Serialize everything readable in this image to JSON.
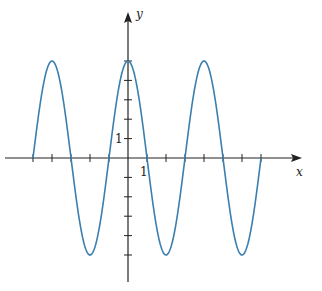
{
  "chart_data": {
    "type": "line",
    "title": "",
    "function": "y = 5cos(πx/2)",
    "xlabel": "x",
    "ylabel": "y",
    "xlim": [
      -5.2,
      8.9
    ],
    "ylim": [
      -5.6,
      6.0
    ],
    "x_tick_values": [
      -5,
      -4,
      -3,
      -2,
      -1,
      0,
      1,
      2,
      3,
      4,
      5,
      6,
      7
    ],
    "y_tick_values": [
      -5,
      -4,
      -3,
      -2,
      -1,
      1,
      2,
      3,
      4,
      5
    ],
    "labeled_ticks": {
      "x": "1",
      "y": "1"
    },
    "domain": [
      -5,
      7
    ],
    "series": [
      {
        "name": "y = 5cos(πx/2)",
        "color": "#3a7fb0",
        "x": [
          -5,
          -4,
          -3,
          -2,
          -1,
          0,
          1,
          2,
          3,
          4,
          5,
          6,
          7
        ],
        "y": [
          0,
          5,
          0,
          -5,
          0,
          5,
          0,
          -5,
          0,
          5,
          0,
          -5,
          0
        ]
      }
    ],
    "grid": false,
    "legend": "none"
  },
  "axes": {
    "x_label": "x",
    "y_label": "y",
    "x_unit_label": "1",
    "y_unit_label": "1",
    "axis_color": "#222222",
    "curve_color": "#3a7fb0"
  }
}
